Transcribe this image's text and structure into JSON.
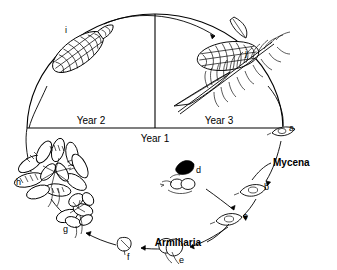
{
  "figure": {
    "kind": "circular-life-cycle-diagram",
    "background_color": "#ffffff",
    "line_color": "#000000"
  },
  "year_labels": {
    "year1": "Year 1",
    "year2": "Year 2",
    "year3": "Year 3"
  },
  "genus_labels": {
    "mycena": "Mycena",
    "armillaria": "Armillaria"
  },
  "stages": [
    {
      "id": "a",
      "label": "a",
      "description": "single spore / basidium",
      "x": 289,
      "y": 131
    },
    {
      "id": "b",
      "label": "b",
      "description": "germinating spore",
      "x": 264,
      "y": 190
    },
    {
      "id": "c",
      "label": "c",
      "description": "germinating spore",
      "x": 243,
      "y": 219
    },
    {
      "id": "d",
      "label": "d",
      "description": "dark sclerotium with hyphae",
      "x": 196,
      "y": 173
    },
    {
      "id": "e",
      "label": "e",
      "description": "young fruiting body",
      "x": 179,
      "y": 253
    },
    {
      "id": "f",
      "label": "f",
      "description": "small fruiting body",
      "x": 129,
      "y": 252
    },
    {
      "id": "g",
      "label": "g",
      "description": "small cluster of fruiting bodies",
      "x": 63,
      "y": 228
    },
    {
      "id": "h",
      "label": "h",
      "description": "large cluster of fruiting bodies",
      "x": 19,
      "y": 185
    },
    {
      "id": "i",
      "label": "i",
      "description": "mature cone, year 2",
      "x": 67,
      "y": 30
    },
    {
      "id": "j",
      "label": "j",
      "description": "cone on conifer branch, year 3",
      "x": 247,
      "y": 52
    }
  ]
}
